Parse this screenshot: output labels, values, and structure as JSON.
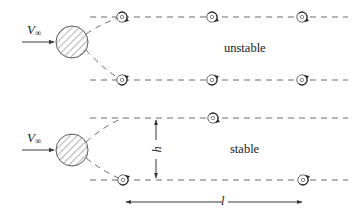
{
  "figure": {
    "width": 352,
    "height": 219,
    "background": "#ffffff",
    "stroke_color": "#3a3a3a",
    "dash_color": "#6b6b6b",
    "text_color": "#1a1a1a"
  },
  "labels": {
    "velocity_top": "V",
    "velocity_top_sub": "∞",
    "velocity_bottom": "V",
    "velocity_bottom_sub": "∞",
    "unstable": "unstable",
    "stable": "stable",
    "spacing_h": "h",
    "spacing_l": "l"
  },
  "panels": [
    {
      "name": "unstable",
      "label": "unstable",
      "label_x": 228,
      "label_y": 45,
      "cylinder": {
        "cx": 72,
        "cy": 42,
        "r": 16
      },
      "inflow_arrow": {
        "x1": 22,
        "y1": 42,
        "x2": 56,
        "y2": 42
      },
      "velocity_label": {
        "x": 27,
        "y": 24
      },
      "rows": [
        {
          "name": "upper-row",
          "y": 17,
          "wake_start_x": 90,
          "wake_end_x": 348,
          "vortices": [
            {
              "x": 122,
              "y": 17,
              "spin": "cw"
            },
            {
              "x": 212,
              "y": 17,
              "spin": "cw"
            },
            {
              "x": 302,
              "y": 17,
              "spin": "cw"
            }
          ]
        },
        {
          "name": "lower-row",
          "y": 80,
          "wake_start_x": 90,
          "wake_end_x": 348,
          "vortices": [
            {
              "x": 122,
              "y": 80,
              "spin": "ccw"
            },
            {
              "x": 212,
              "y": 80,
              "spin": "ccw"
            },
            {
              "x": 302,
              "y": 80,
              "spin": "ccw"
            }
          ]
        }
      ],
      "separation_curves": [
        {
          "from_x": 86,
          "from_y": 34,
          "to_x": 122,
          "to_y": 17
        },
        {
          "from_x": 86,
          "from_y": 50,
          "to_x": 122,
          "to_y": 80
        }
      ]
    },
    {
      "name": "stable",
      "label": "stable",
      "label_x": 228,
      "label_y": 146,
      "cylinder": {
        "cx": 72,
        "cy": 150,
        "r": 16
      },
      "inflow_arrow": {
        "x1": 22,
        "y1": 150,
        "x2": 56,
        "y2": 150
      },
      "velocity_label": {
        "x": 27,
        "y": 132
      },
      "rows": [
        {
          "name": "upper-row",
          "y": 118,
          "wake_start_x": 90,
          "wake_end_x": 348,
          "vortices": [
            {
              "x": 213,
              "y": 118,
              "spin": "cw"
            }
          ]
        },
        {
          "name": "lower-row",
          "y": 180,
          "wake_start_x": 90,
          "wake_end_x": 348,
          "vortices": [
            {
              "x": 123,
              "y": 180,
              "spin": "ccw"
            },
            {
              "x": 303,
              "y": 180,
              "spin": "ccw"
            }
          ]
        }
      ],
      "separation_curves": [
        {
          "from_x": 86,
          "from_y": 142,
          "to_x": 123,
          "to_y": 118
        },
        {
          "from_x": 86,
          "from_y": 158,
          "to_x": 123,
          "to_y": 180
        }
      ]
    }
  ],
  "dimensions": [
    {
      "name": "h-spacing",
      "label": "h",
      "orientation": "vertical",
      "x": 156,
      "y1": 118,
      "y2": 180,
      "label_x": 156,
      "label_y": 149
    },
    {
      "name": "l-spacing",
      "label": "l",
      "orientation": "horizontal",
      "y": 202,
      "x1": 124,
      "x2": 304,
      "label_x": 214,
      "label_y": 202
    }
  ]
}
